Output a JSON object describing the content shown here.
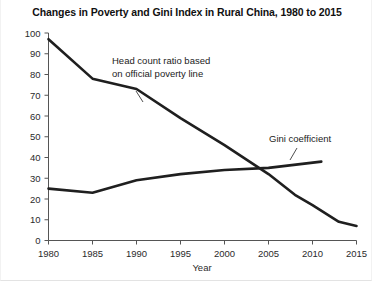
{
  "chart_data": {
    "type": "line",
    "title": "Changes in Poverty and Gini Index in Rural China, 1980 to 2015",
    "xlabel": "Year",
    "ylabel": "",
    "xlim": [
      1980,
      2015
    ],
    "ylim": [
      0,
      100
    ],
    "xticks": [
      1980,
      1985,
      1990,
      1995,
      2000,
      2005,
      2010,
      2015
    ],
    "yticks": [
      0,
      10,
      20,
      30,
      40,
      50,
      60,
      70,
      80,
      90,
      100
    ],
    "xtick_labels": [
      "1980",
      "1985",
      "1990",
      "1995",
      "2000",
      "2005",
      "2010",
      "2015"
    ],
    "ytick_labels": [
      "0",
      "10",
      "20",
      "30",
      "40",
      "50",
      "60",
      "70",
      "80",
      "90",
      "100"
    ],
    "grid": false,
    "legend_position": "inline-annotations",
    "series": [
      {
        "name": "Head count ratio based on official poverty line",
        "x": [
          1980,
          1985,
          1990,
          1995,
          2000,
          2005,
          2008,
          2010,
          2013,
          2015
        ],
        "values": [
          97,
          78,
          73,
          59,
          46,
          32,
          22,
          17,
          9,
          7
        ],
        "color": "#1f1f1f"
      },
      {
        "name": "Gini coefficient",
        "x": [
          1980,
          1985,
          1990,
          1995,
          2000,
          2005,
          2011
        ],
        "values": [
          25,
          23,
          29,
          32,
          34,
          35,
          38
        ],
        "color": "#1f1f1f"
      }
    ],
    "annotations": [
      {
        "name": "poverty-line-label",
        "lines": [
          "Head count ratio based",
          "on official poverty line"
        ],
        "x": 1995,
        "y": 80
      },
      {
        "name": "gini-label",
        "lines": [
          "Gini coefficient"
        ],
        "x": 2008,
        "y": 46
      }
    ]
  }
}
